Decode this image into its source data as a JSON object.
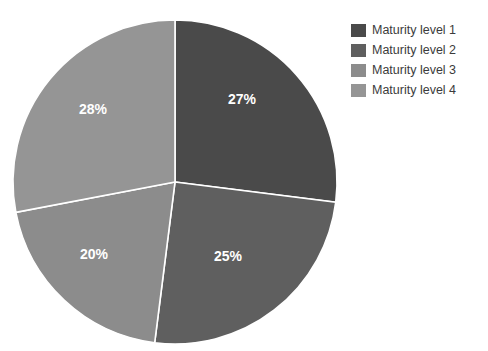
{
  "chart_data": {
    "type": "pie",
    "title": "",
    "categories": [
      "Maturity level 1",
      "Maturity level 2",
      "Maturity level 3",
      "Maturity level 4"
    ],
    "values": [
      27,
      25,
      20,
      28
    ],
    "value_labels": [
      "27%",
      "25%",
      "20%",
      "28%"
    ],
    "colors": [
      "#4a4a4a",
      "#5f5f5f",
      "#8c8c8c",
      "#959595"
    ],
    "start_angle_deg": 0,
    "direction": "clockwise",
    "slice_gap_color": "#ffffff",
    "label_color": "#ffffff",
    "legend_position": "right",
    "grid": false
  },
  "legend": {
    "items": [
      {
        "label": "Maturity level 1",
        "color": "#4a4a4a"
      },
      {
        "label": "Maturity level 2",
        "color": "#5f5f5f"
      },
      {
        "label": "Maturity level 3",
        "color": "#8c8c8c"
      },
      {
        "label": "Maturity level 4",
        "color": "#959595"
      }
    ]
  },
  "slices": [
    {
      "label": "27%",
      "x": 242,
      "y": 100
    },
    {
      "label": "25%",
      "x": 228,
      "y": 257
    },
    {
      "label": "20%",
      "x": 94,
      "y": 255
    },
    {
      "label": "28%",
      "x": 93,
      "y": 110
    }
  ]
}
